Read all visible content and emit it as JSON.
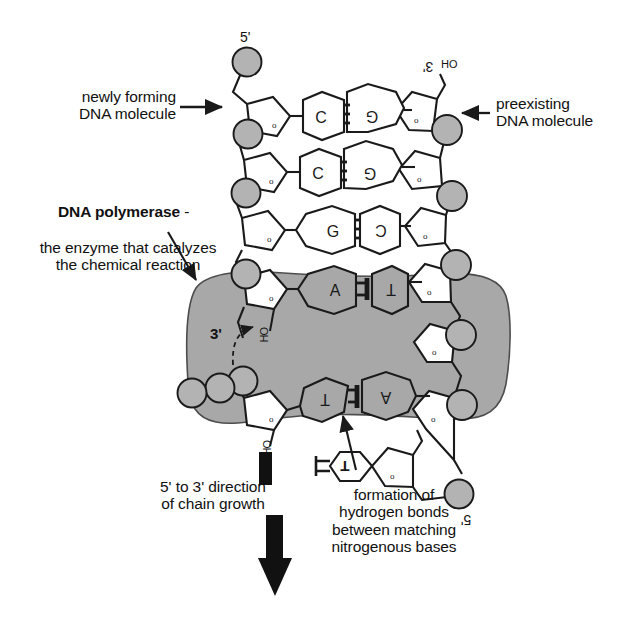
{
  "diagram": {
    "colors": {
      "stroke": "#1a1a1a",
      "phosphate_fill": "#b3b3b3",
      "enzyme_fill": "#a8a8a8",
      "sugar_fill": "#ffffff",
      "background": "#ffffff"
    }
  },
  "labels": {
    "newly_forming": "newly forming\nDNA molecule",
    "preexisting": "preexisting\nDNA molecule",
    "polymerase_bold": "DNA  polymerase",
    "polymerase_dash": " -",
    "polymerase_rest": "the enzyme that catalyzes\nthe chemical reaction",
    "chain_growth": "5' to 3' direction\nof chain growth",
    "hydrogen_bonds": "formation of\nhydrogen bonds\nbetween matching\nnitrogenous bases"
  },
  "end_labels": {
    "top_left_5prime": "5'",
    "top_right_3prime": "3'",
    "top_right_oh": "OH",
    "enzyme_3prime": "3'",
    "enzyme_oh_upper": "OH",
    "enzyme_oh_lower": "OH",
    "bottom_right_5prime": "5'"
  },
  "base_pairs": [
    {
      "left": "C",
      "right": "G",
      "bonds": 3,
      "region": "duplex"
    },
    {
      "left": "C",
      "right": "G",
      "bonds": 3,
      "region": "duplex"
    },
    {
      "left": "G",
      "right": "C",
      "bonds": 3,
      "region": "duplex"
    },
    {
      "left": "A",
      "right": "T",
      "bonds": 2,
      "region": "enzyme"
    },
    {
      "left": "T",
      "right": "A",
      "bonds": 2,
      "region": "enzyme"
    }
  ],
  "free_nucleotide": {
    "base": "T",
    "bonds": 2,
    "five_prime": "5'"
  },
  "sugar_oxygen_glyph": "o",
  "arrows": {
    "newly_forming_arrow": "→",
    "preexisting_arrow": "←",
    "polymerase_arrow": "diagonal-down-right",
    "hydrogen_arrow": "diagonal-up-right",
    "growth_arrow": "thick-down",
    "oh_attack_arrow": "dashed-curve"
  }
}
